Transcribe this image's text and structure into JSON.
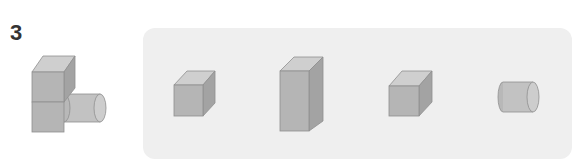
{
  "question": {
    "number": "3",
    "composite_shape": {
      "description": "two stacked cubes with a cylinder attached to the lower cube",
      "parts": [
        "cube",
        "cube",
        "cylinder"
      ]
    },
    "choices_panel": {
      "background": "#efefef",
      "choices": [
        {
          "index": 1,
          "shape": "cube"
        },
        {
          "index": 2,
          "shape": "rectangular-prism"
        },
        {
          "index": 3,
          "shape": "cube"
        },
        {
          "index": 4,
          "shape": "cylinder"
        }
      ]
    }
  },
  "colors": {
    "front": "#b5b5b5",
    "top": "#cfcfcf",
    "side": "#a3a3a3",
    "edge": "#8f8f8f",
    "text": "#333333"
  }
}
